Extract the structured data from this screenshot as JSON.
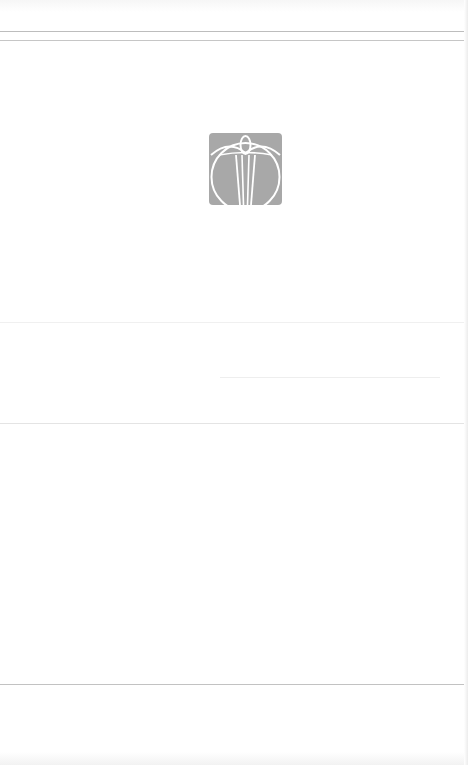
{
  "page": {
    "background": "#ffffff",
    "rules": [
      {
        "top": 31,
        "width": 468,
        "color": "#bdbdbd"
      },
      {
        "top": 40,
        "width": 468,
        "color": "#c6c6c6"
      },
      {
        "top": 322,
        "width": 468,
        "color": "#f0f0f0"
      },
      {
        "top": 377,
        "width": 440,
        "color": "#eeeeee"
      },
      {
        "top": 423,
        "width": 468,
        "color": "#e4e4e4"
      },
      {
        "top": 684,
        "width": 468,
        "color": "#c2c2c2"
      }
    ]
  },
  "logo": {
    "icon": "emblem-logo-icon",
    "fill": "#a8a8a8",
    "stroke": "#ffffff"
  }
}
